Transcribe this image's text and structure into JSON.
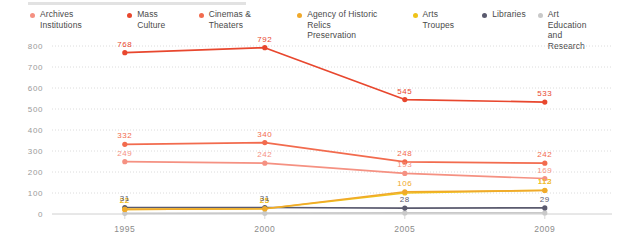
{
  "legend": {
    "position": "top",
    "items": [
      {
        "label": "Archives Institutions",
        "color": "#F59182",
        "icon": "legend-dot-icon"
      },
      {
        "label": "Mass Culture",
        "color": "#E8472E",
        "icon": "legend-dot-icon"
      },
      {
        "label": "Cinemas & Theaters",
        "color": "#F26B4E",
        "icon": "legend-dot-icon"
      },
      {
        "label": "Agency of Historic Relics\nPreservation",
        "color": "#F0A92B",
        "icon": "legend-dot-icon"
      },
      {
        "label": "Arts Troupes",
        "color": "#EFC319",
        "icon": "legend-dot-icon"
      },
      {
        "label": "Libraries",
        "color": "#5A5A6E",
        "icon": "legend-dot-icon"
      },
      {
        "label": "Art Education\nand Research",
        "color": "#C9C9C9",
        "icon": "legend-dot-icon"
      }
    ]
  },
  "chart_data": {
    "type": "line",
    "title": "",
    "xlabel": "",
    "ylabel": "",
    "categories": [
      "1995",
      "2000",
      "2005",
      "2009"
    ],
    "ylim": [
      0,
      800
    ],
    "ytick_values": [
      0,
      100,
      200,
      300,
      400,
      500,
      600,
      700,
      800
    ],
    "ytick_labels": [
      "0",
      "100",
      "200",
      "300",
      "400",
      "500",
      "600",
      "700",
      "800"
    ],
    "grid": true,
    "grid_style": "dotted-horizontal",
    "legend_position": "top",
    "show_point_labels": true,
    "series": [
      {
        "name": "Mass Culture",
        "color": "#E8472E",
        "values": [
          768,
          792,
          545,
          533
        ],
        "labels": [
          "768",
          "792",
          "545",
          "533"
        ]
      },
      {
        "name": "Cinemas & Theaters",
        "color": "#F26B4E",
        "values": [
          332,
          340,
          248,
          242
        ],
        "labels": [
          "332",
          "340",
          "248",
          "242"
        ]
      },
      {
        "name": "Archives Institutions",
        "color": "#F59182",
        "values": [
          249,
          242,
          193,
          169
        ],
        "labels": [
          "249",
          "242",
          "193",
          "169"
        ]
      },
      {
        "name": "Agency of Historic Relics Preservation",
        "color": "#F0A92B",
        "values": [
          22,
          25,
          106,
          112
        ],
        "labels": [
          "22",
          "25",
          "106",
          "112"
        ]
      },
      {
        "name": "Arts Troupes",
        "color": "#EFC319",
        "values": [
          22,
          25,
          100,
          113
        ],
        "labels": [
          "22",
          "25",
          "",
          "113"
        ]
      },
      {
        "name": "Libraries",
        "color": "#5A5A6E",
        "values": [
          31,
          31,
          28,
          29
        ],
        "labels": [
          "31",
          "31",
          "28",
          "29"
        ]
      },
      {
        "name": "Art Education and Research",
        "color": "#C9C9C9",
        "values": [
          3,
          4,
          5,
          5
        ],
        "labels": [
          "",
          "",
          "",
          ""
        ]
      }
    ]
  }
}
